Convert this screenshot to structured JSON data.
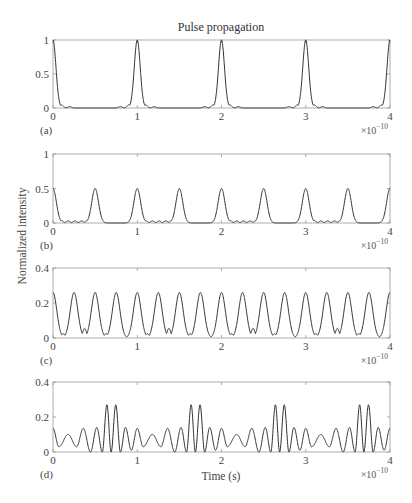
{
  "figure": {
    "title": "Pulse propagation",
    "ylabel": "Normalized intensity",
    "xlabel": "Time (s)",
    "x_multiplier_base": "×10",
    "x_multiplier_exp": "−10",
    "line_color": "#333333",
    "axis_color": "#999999"
  },
  "chart_data": [
    {
      "panel": "(a)",
      "type": "line",
      "title": "Pulse propagation",
      "xlabel": "",
      "ylabel": "Normalized intensity",
      "xlim": [
        0,
        4
      ],
      "x_scale": "×10^-10",
      "ylim": [
        0,
        1
      ],
      "xticks": [
        "0",
        "1",
        "2",
        "3",
        "4"
      ],
      "yticks": [
        "0",
        "0.5",
        "1"
      ],
      "description": "Pulse train: narrow peaks of height 1 every 1e-10 s with small side ripples (~0.04) adjacent to each peak",
      "period": 1,
      "peaks": [
        {
          "x": 0,
          "y": 1,
          "w": 0.035
        }
      ],
      "ripples": [
        {
          "x": 0.1,
          "y": 0.045
        },
        {
          "x": 0.2,
          "y": 0.02
        },
        {
          "x": 0.8,
          "y": 0.02
        },
        {
          "x": 0.9,
          "y": 0.045
        }
      ]
    },
    {
      "panel": "(b)",
      "type": "line",
      "xlabel": "",
      "xlim": [
        0,
        4
      ],
      "x_scale": "×10^-10",
      "ylim": [
        0,
        1
      ],
      "xticks": [
        "0",
        "1",
        "2",
        "3",
        "4"
      ],
      "yticks": [
        "0",
        "0.5",
        "1"
      ],
      "description": "Peaks of height 0.5 every 0.5e-10 s; small ripples (~0.03) between integer and half-integer peaks",
      "period": 1,
      "peaks": [
        {
          "x": 0,
          "y": 0.5,
          "w": 0.04
        },
        {
          "x": 0.5,
          "y": 0.5,
          "w": 0.04
        }
      ],
      "ripples": [
        {
          "x": 0.1,
          "y": 0.035
        },
        {
          "x": 0.18,
          "y": 0.03
        },
        {
          "x": 0.26,
          "y": 0.03
        },
        {
          "x": 0.34,
          "y": 0.03
        },
        {
          "x": 0.41,
          "y": 0.035
        }
      ]
    },
    {
      "panel": "(c)",
      "type": "line",
      "xlabel": "",
      "xlim": [
        0,
        4
      ],
      "x_scale": "×10^-10",
      "ylim": [
        0,
        0.4
      ],
      "xticks": [
        "0",
        "1",
        "2",
        "3",
        "4"
      ],
      "yticks": [
        "0",
        "0.2",
        "0.4"
      ],
      "description": "Peaks of height ~0.26 every 0.25e-10 s with small sub-peaks between",
      "period": 1,
      "peaks": [
        {
          "x": 0,
          "y": 0.26,
          "w": 0.045
        },
        {
          "x": 0.25,
          "y": 0.26,
          "w": 0.045
        },
        {
          "x": 0.5,
          "y": 0.26,
          "w": 0.045
        },
        {
          "x": 0.75,
          "y": 0.26,
          "w": 0.045
        }
      ],
      "ripples": [
        {
          "x": 0.12,
          "y": 0.025
        },
        {
          "x": 0.375,
          "y": 0.055
        },
        {
          "x": 0.63,
          "y": 0.025
        }
      ]
    },
    {
      "panel": "(d)",
      "type": "line",
      "xlabel": "Time (s)",
      "xlim": [
        0,
        4
      ],
      "x_scale": "×10^-10",
      "ylim": [
        0,
        0.4
      ],
      "xticks": [
        "0",
        "1",
        "2",
        "3",
        "4"
      ],
      "yticks": [
        "0",
        "0.2",
        "0.4"
      ],
      "description": "Oscillating intensity with pairs of tall peaks (~0.27) near 0.64 and 0.74 in each period, smaller peaks 0.1-0.14 elsewhere",
      "period": 1,
      "osc": [
        {
          "x": 0.0,
          "y": 0.135
        },
        {
          "x": 0.07,
          "y": 0.03
        },
        {
          "x": 0.18,
          "y": 0.1
        },
        {
          "x": 0.28,
          "y": 0.03
        },
        {
          "x": 0.36,
          "y": 0.135
        },
        {
          "x": 0.445,
          "y": 0.0
        },
        {
          "x": 0.52,
          "y": 0.14
        },
        {
          "x": 0.585,
          "y": 0.0
        },
        {
          "x": 0.64,
          "y": 0.27
        },
        {
          "x": 0.69,
          "y": 0.0
        },
        {
          "x": 0.745,
          "y": 0.27
        },
        {
          "x": 0.8,
          "y": 0.0
        },
        {
          "x": 0.86,
          "y": 0.14
        },
        {
          "x": 0.93,
          "y": 0.01
        },
        {
          "x": 1.0,
          "y": 0.135
        }
      ]
    }
  ]
}
